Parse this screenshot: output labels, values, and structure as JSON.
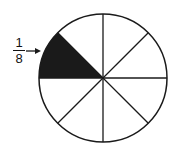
{
  "diagram": {
    "type": "fraction-circle",
    "segments": 8,
    "shaded_segments": 1,
    "label": {
      "numerator": "1",
      "denominator": "8"
    },
    "colors": {
      "stroke": "#1a1a1a",
      "shade": "#1a1a1a",
      "fill": "#ffffff"
    }
  }
}
